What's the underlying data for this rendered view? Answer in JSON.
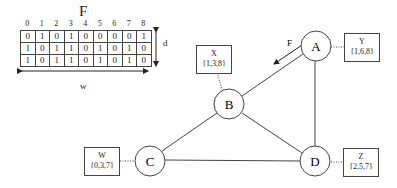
{
  "matrix": {
    "title": "F",
    "column_indices": [
      "0",
      "1",
      "2",
      "3",
      "4",
      "5",
      "6",
      "7",
      "8"
    ],
    "rows": [
      [
        "0",
        "1",
        "0",
        "1",
        "0",
        "0",
        "0",
        "0",
        "1"
      ],
      [
        "1",
        "0",
        "1",
        "1",
        "0",
        "1",
        "0",
        "1",
        "0"
      ],
      [
        "1",
        "0",
        "1",
        "1",
        "0",
        "1",
        "0",
        "1",
        "0"
      ]
    ],
    "height_label": "d",
    "width_label": "w"
  },
  "graph": {
    "nodes": [
      {
        "id": "A",
        "label": "A"
      },
      {
        "id": "B",
        "label": "B"
      },
      {
        "id": "C",
        "label": "C"
      },
      {
        "id": "D",
        "label": "D"
      }
    ],
    "edges": [
      [
        "A",
        "B"
      ],
      [
        "A",
        "D"
      ],
      [
        "B",
        "C"
      ],
      [
        "B",
        "D"
      ],
      [
        "C",
        "D"
      ]
    ],
    "flow_label": "F",
    "sets": [
      {
        "node": "B",
        "name": "X",
        "values": "{1,3,8}"
      },
      {
        "node": "A",
        "name": "Y",
        "values": "{1,6,8}"
      },
      {
        "node": "C",
        "name": "W",
        "values": "{0,3,7}"
      },
      {
        "node": "D",
        "name": "Z",
        "values": "{2,5,7}"
      }
    ]
  }
}
